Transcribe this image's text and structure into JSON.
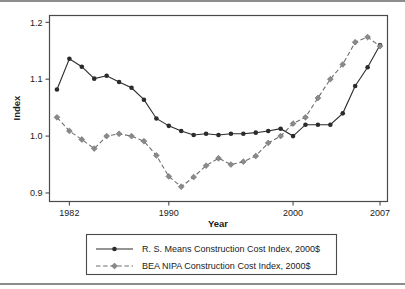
{
  "figure": {
    "kind": "line-chart-figure",
    "rules": {
      "top": true,
      "bottom": true
    }
  },
  "chart_data": {
    "type": "line",
    "title": "",
    "xlabel": "Year",
    "ylabel": "Index",
    "xlim": [
      1980.4,
      2007.6
    ],
    "ylim": [
      0.885,
      1.212
    ],
    "grid": false,
    "legend_position": "below-plot",
    "xticks": [
      1982,
      1990,
      2000,
      2007
    ],
    "xtick_labels": [
      "1982",
      "1990",
      "2000",
      "2007"
    ],
    "yticks": [
      0.9,
      1.0,
      1.1,
      1.2
    ],
    "ytick_labels": [
      "0.9",
      "1.0",
      "1.1",
      "1.2"
    ],
    "x": [
      1981,
      1982,
      1983,
      1984,
      1985,
      1986,
      1987,
      1988,
      1989,
      1990,
      1991,
      1992,
      1993,
      1994,
      1995,
      1996,
      1997,
      1998,
      1999,
      2000,
      2001,
      2002,
      2003,
      2004,
      2005,
      2006,
      2007
    ],
    "series": [
      {
        "name": "R. S. Means Construction Cost Index, 2000$",
        "color": "#2b2b2b",
        "marker": "circle",
        "dash": "solid",
        "values": [
          1.082,
          1.136,
          1.122,
          1.101,
          1.106,
          1.095,
          1.085,
          1.064,
          1.031,
          1.018,
          1.009,
          1.002,
          1.004,
          1.002,
          1.004,
          1.004,
          1.006,
          1.009,
          1.013,
          1.0,
          1.02,
          1.02,
          1.02,
          1.04,
          1.088,
          1.121,
          1.16
        ]
      },
      {
        "name": "BEA NIPA Construction Cost Index, 2000$",
        "color": "#8a8a8a",
        "marker": "diamond",
        "dash": "dashed",
        "values": [
          1.033,
          1.009,
          0.994,
          0.978,
          1.0,
          1.004,
          1.0,
          0.991,
          0.966,
          0.929,
          0.911,
          0.928,
          0.948,
          0.961,
          0.95,
          0.955,
          0.965,
          0.988,
          1.0,
          1.022,
          1.033,
          1.067,
          1.1,
          1.126,
          1.165,
          1.174,
          1.158
        ]
      }
    ]
  }
}
